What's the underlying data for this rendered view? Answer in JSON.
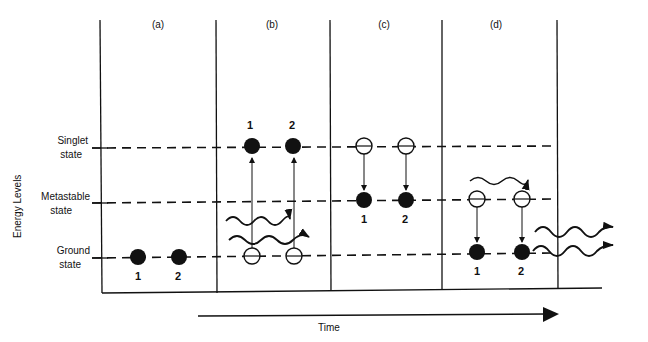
{
  "figure": {
    "y_axis_label": "Energy Levels",
    "x_axis_label": "Time",
    "levels": [
      {
        "name": "singlet",
        "label_line1": "Singlet",
        "label_line2": "state"
      },
      {
        "name": "metastable",
        "label_line1": "Metastable",
        "label_line2": "state"
      },
      {
        "name": "ground",
        "label_line1": "Ground",
        "label_line2": "state"
      }
    ],
    "panels": [
      {
        "id": "a",
        "label": "(a)",
        "description": "Both electrons 1 and 2 in ground state",
        "electron_labels": [
          "1",
          "2"
        ]
      },
      {
        "id": "b",
        "label": "(b)",
        "description": "Photons absorbed; electrons 1 and 2 excited from ground to singlet state",
        "electron_labels": [
          "1",
          "2"
        ]
      },
      {
        "id": "c",
        "label": "(c)",
        "description": "Electrons decay from singlet to metastable state",
        "electron_labels": [
          "1",
          "2"
        ]
      },
      {
        "id": "d",
        "label": "(d)",
        "description": "Stimulating photon triggers decay from metastable to ground; coherent photons emitted",
        "electron_labels": [
          "1",
          "2"
        ]
      }
    ]
  },
  "colors": {
    "ink": "#111111",
    "background": "#ffffff"
  }
}
